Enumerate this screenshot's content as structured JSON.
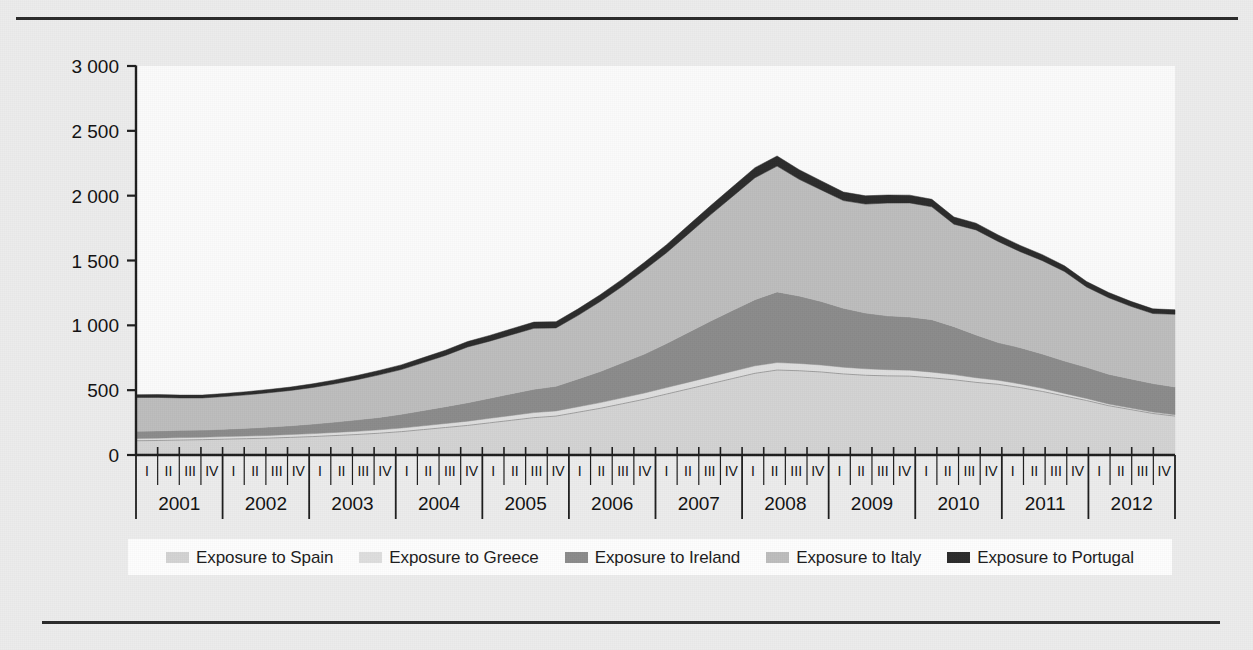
{
  "chart_data": {
    "type": "area",
    "stacked": true,
    "title": "",
    "subtitle": "",
    "xlabel": "",
    "ylabel": "",
    "ylim": [
      0,
      3000
    ],
    "yticks": [
      0,
      500,
      1000,
      1500,
      2000,
      2500,
      3000
    ],
    "ytick_labels": [
      "0",
      "500",
      "1 000",
      "1 500",
      "2 000",
      "2 500",
      "3 000"
    ],
    "grid": false,
    "legend_position": "bottom",
    "years": [
      "2001",
      "2002",
      "2003",
      "2004",
      "2005",
      "2006",
      "2007",
      "2008",
      "2009",
      "2010",
      "2011",
      "2012"
    ],
    "quarters": [
      "I",
      "II",
      "III",
      "IV"
    ],
    "x": [
      "2001 I",
      "2001 II",
      "2001 III",
      "2001 IV",
      "2002 I",
      "2002 II",
      "2002 III",
      "2002 IV",
      "2003 I",
      "2003 II",
      "2003 III",
      "2003 IV",
      "2004 I",
      "2004 II",
      "2004 III",
      "2004 IV",
      "2005 I",
      "2005 II",
      "2005 III",
      "2005 IV",
      "2006 I",
      "2006 II",
      "2006 III",
      "2006 IV",
      "2007 I",
      "2007 II",
      "2007 III",
      "2007 IV",
      "2008 I",
      "2008 II",
      "2008 III",
      "2008 IV",
      "2009 I",
      "2009 II",
      "2009 III",
      "2009 IV",
      "2010 I",
      "2010 II",
      "2010 III",
      "2010 IV",
      "2011 I",
      "2011 II",
      "2011 III",
      "2011 IV",
      "2012 I",
      "2012 II",
      "2012 III",
      "2012 IV"
    ],
    "series": [
      {
        "name": "Exposure to Spain",
        "color": "#d2d2d2",
        "values": [
          110,
          112,
          115,
          118,
          122,
          126,
          130,
          136,
          142,
          150,
          158,
          168,
          180,
          196,
          212,
          228,
          248,
          268,
          288,
          300,
          330,
          360,
          395,
          430,
          470,
          510,
          550,
          590,
          630,
          655,
          650,
          640,
          625,
          615,
          610,
          608,
          595,
          580,
          560,
          545,
          520,
          490,
          455,
          420,
          380,
          350,
          320,
          300
        ]
      },
      {
        "name": "Exposure to Greece",
        "color": "#dedede",
        "values": [
          18,
          18,
          19,
          19,
          20,
          20,
          21,
          22,
          23,
          24,
          25,
          26,
          28,
          29,
          31,
          33,
          35,
          37,
          39,
          40,
          42,
          44,
          46,
          48,
          50,
          52,
          54,
          56,
          58,
          58,
          56,
          54,
          52,
          50,
          48,
          46,
          44,
          40,
          36,
          32,
          28,
          24,
          20,
          16,
          13,
          12,
          11,
          10
        ]
      },
      {
        "name": "Exposure to Ireland",
        "color": "#8b8b8b",
        "values": [
          55,
          56,
          56,
          55,
          57,
          60,
          64,
          68,
          74,
          80,
          88,
          96,
          106,
          118,
          130,
          142,
          155,
          168,
          180,
          190,
          215,
          240,
          270,
          300,
          340,
          385,
          430,
          470,
          510,
          545,
          520,
          490,
          455,
          430,
          415,
          410,
          405,
          370,
          330,
          290,
          280,
          265,
          250,
          240,
          230,
          225,
          220,
          215
        ]
      },
      {
        "name": "Exposure to Italy",
        "color": "#bcbcbc",
        "values": [
          260,
          258,
          250,
          248,
          252,
          258,
          265,
          272,
          282,
          295,
          310,
          328,
          345,
          370,
          395,
          430,
          440,
          455,
          470,
          450,
          490,
          540,
          590,
          650,
          700,
          760,
          820,
          880,
          940,
          970,
          900,
          860,
          830,
          840,
          870,
          880,
          870,
          790,
          810,
          780,
          740,
          720,
          690,
          620,
          590,
          560,
          540,
          560
        ]
      },
      {
        "name": "Exposure to Portugal",
        "color": "#2b2b2b",
        "values": [
          22,
          22,
          22,
          22,
          23,
          24,
          25,
          26,
          28,
          30,
          32,
          34,
          36,
          38,
          40,
          42,
          44,
          46,
          48,
          48,
          50,
          52,
          55,
          58,
          62,
          66,
          70,
          74,
          78,
          78,
          74,
          70,
          66,
          64,
          62,
          60,
          58,
          55,
          52,
          50,
          48,
          46,
          44,
          42,
          40,
          38,
          36,
          35
        ]
      }
    ]
  },
  "axes": {
    "y_axis_label_color": "#111111",
    "axis_color": "#1d1d1d",
    "plot_background": "#fbfbfb"
  },
  "legend": {
    "items": [
      {
        "label": "Exposure to Spain",
        "swatch": "#d2d2d2"
      },
      {
        "label": "Exposure to Greece",
        "swatch": "#dedede"
      },
      {
        "label": "Exposure to Ireland",
        "swatch": "#8b8b8b"
      },
      {
        "label": "Exposure to Italy",
        "swatch": "#bcbcbc"
      },
      {
        "label": "Exposure to Portugal",
        "swatch": "#2b2b2b"
      }
    ]
  }
}
